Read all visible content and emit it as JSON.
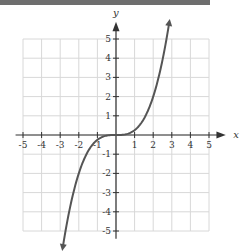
{
  "chart_data": {
    "type": "line",
    "title": "",
    "xlabel": "x",
    "ylabel": "y",
    "xlim": [
      -5,
      5
    ],
    "ylim": [
      -5,
      5
    ],
    "grid": true,
    "x_ticks": [
      "-5",
      "-4",
      "-3",
      "-2",
      "-1",
      "1",
      "2",
      "3",
      "4",
      "5"
    ],
    "y_ticks": [
      "5",
      "4",
      "3",
      "2",
      "1",
      "-1",
      "-2",
      "-3",
      "-4",
      "-5"
    ],
    "series": [
      {
        "name": "y = x^3/4",
        "color": "#555555",
        "x": [
          -2.85,
          -2.5,
          -2,
          -1.5,
          -1,
          -0.5,
          0,
          0.5,
          1,
          1.5,
          2,
          2.5,
          2.85
        ],
        "y": [
          -5.79,
          -3.91,
          -2.0,
          -0.84,
          -0.25,
          -0.03,
          0,
          0.03,
          0.25,
          0.84,
          2.0,
          3.91,
          5.79
        ]
      }
    ],
    "colors": {
      "grid": "#d8d8d8",
      "axis": "#333333",
      "curve": "#555555",
      "header_bar": "#6e6e6e"
    }
  }
}
